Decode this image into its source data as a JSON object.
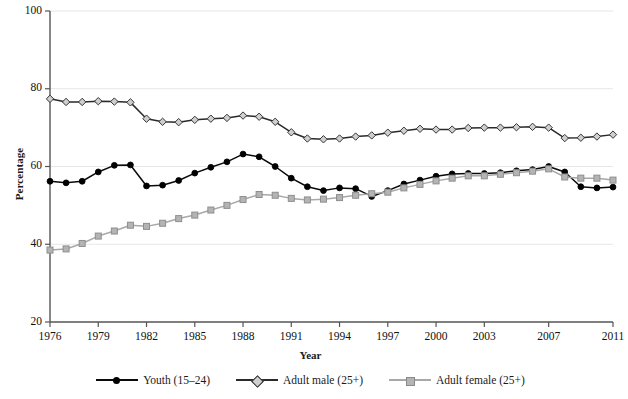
{
  "chart_data": {
    "type": "line",
    "title": "",
    "xlabel": "Year",
    "ylabel": "Percentage",
    "ylim": [
      20,
      100
    ],
    "yticks": [
      20,
      40,
      60,
      80,
      100
    ],
    "xlim": [
      1976,
      2011
    ],
    "xticks": [
      1976,
      1979,
      1982,
      1985,
      1988,
      1991,
      1994,
      1997,
      2000,
      2003,
      2007,
      2011
    ],
    "grid": "horizontal",
    "legend_position": "bottom",
    "x": [
      1976,
      1977,
      1978,
      1979,
      1980,
      1981,
      1982,
      1983,
      1984,
      1985,
      1986,
      1987,
      1988,
      1989,
      1990,
      1991,
      1992,
      1993,
      1994,
      1995,
      1996,
      1997,
      1998,
      1999,
      2000,
      2001,
      2002,
      2003,
      2004,
      2005,
      2006,
      2007,
      2008,
      2009,
      2010,
      2011
    ],
    "series": [
      {
        "name": "Youth (15–24)",
        "color": "#000000",
        "marker": "circle",
        "values": [
          56.2,
          55.8,
          56.2,
          58.6,
          60.3,
          60.4,
          55.0,
          55.2,
          56.4,
          58.3,
          59.8,
          61.2,
          63.2,
          62.5,
          60.0,
          57.0,
          54.8,
          53.8,
          54.5,
          54.3,
          52.3,
          53.8,
          55.5,
          56.5,
          57.5,
          58.1,
          58.2,
          58.2,
          58.4,
          58.9,
          59.2,
          60.0,
          58.6,
          54.8,
          54.5,
          54.7
        ]
      },
      {
        "name": "Adult male (25+)",
        "color": "#cfcfcf",
        "marker": "diamond",
        "values": [
          77.4,
          76.6,
          76.6,
          76.8,
          76.7,
          76.5,
          72.3,
          71.5,
          71.4,
          72.0,
          72.3,
          72.5,
          73.1,
          72.8,
          71.5,
          68.8,
          67.2,
          67.0,
          67.2,
          67.7,
          68.0,
          68.7,
          69.2,
          69.7,
          69.5,
          69.5,
          69.9,
          70.0,
          70.0,
          70.1,
          70.2,
          70.0,
          67.3,
          67.4,
          67.7,
          68.2
        ]
      },
      {
        "name": "Adult female (25+)",
        "color": "#b4b4b4",
        "marker": "square",
        "values": [
          38.5,
          38.8,
          40.2,
          42.1,
          43.4,
          44.9,
          44.6,
          45.4,
          46.6,
          47.5,
          48.8,
          50.0,
          51.5,
          52.8,
          52.6,
          51.8,
          51.4,
          51.6,
          52.0,
          52.6,
          53.0,
          53.4,
          54.5,
          55.4,
          56.3,
          57.0,
          57.6,
          57.6,
          58.0,
          58.4,
          58.8,
          59.4,
          57.3,
          57.0,
          57.0,
          56.5
        ]
      }
    ]
  },
  "axes": {
    "ytick_labels": [
      "100",
      "80",
      "60",
      "40",
      "20"
    ],
    "xtick_labels": [
      "1976",
      "1979",
      "1982",
      "1985",
      "1988",
      "1991",
      "1994",
      "1997",
      "2000",
      "2003",
      "2007",
      "2011"
    ],
    "xlabel": "Year",
    "ylabel": "Percentage"
  },
  "legend": {
    "items": [
      {
        "label": "Youth (15–24)"
      },
      {
        "label": "Adult male (25+)"
      },
      {
        "label": "Adult female (25+)"
      }
    ]
  }
}
